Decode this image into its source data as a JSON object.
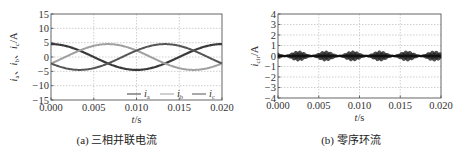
{
  "chart_data": [
    {
      "type": "line",
      "caption": "(a) 三相并联电流",
      "xlabel": "t/s",
      "ylabel": "ia、ib、ic/A",
      "xlim": [
        0.0,
        0.02
      ],
      "ylim": [
        -15,
        15
      ],
      "xticks": [
        "0.000",
        "0.005",
        "0.010",
        "0.015",
        "0.020"
      ],
      "yticks": [
        "15",
        "10",
        "5",
        "0",
        "-5",
        "-10",
        "-15"
      ],
      "grid": true,
      "legend_position": "lower right",
      "series": [
        {
          "name": "ia",
          "color": "#3a3a3a",
          "amplitude": 4.5,
          "frequency_hz": 50,
          "phase_deg": 0,
          "x": [
            0.0,
            0.0025,
            0.005,
            0.0075,
            0.01,
            0.0125,
            0.015,
            0.0175,
            0.02
          ],
          "values": [
            4.5,
            3.2,
            0.0,
            -3.2,
            -4.5,
            -3.2,
            0.0,
            3.2,
            4.5
          ]
        },
        {
          "name": "ib",
          "color": "#a0a0a0",
          "amplitude": 4.5,
          "frequency_hz": 50,
          "phase_deg": -120,
          "x": [
            0.0,
            0.0025,
            0.005,
            0.0075,
            0.01,
            0.0125,
            0.015,
            0.0175,
            0.02
          ],
          "values": [
            -2.25,
            -4.35,
            -3.9,
            -1.16,
            2.25,
            4.35,
            3.9,
            1.16,
            -2.25
          ]
        },
        {
          "name": "ic",
          "color": "#555555",
          "amplitude": 4.5,
          "frequency_hz": 50,
          "phase_deg": 120,
          "x": [
            0.0,
            0.0025,
            0.005,
            0.0075,
            0.01,
            0.0125,
            0.015,
            0.0175,
            0.02
          ],
          "values": [
            -2.25,
            1.16,
            3.9,
            4.35,
            2.25,
            -1.16,
            -3.9,
            -4.35,
            -2.25
          ]
        }
      ],
      "legend": [
        "ia",
        "ib",
        "ic"
      ]
    },
    {
      "type": "line",
      "caption": "(b) 零序环流",
      "xlabel": "t/s",
      "ylabel": "icir/A",
      "xlim": [
        0.0,
        0.02
      ],
      "ylim": [
        -4,
        4
      ],
      "xticks": [
        "0.000",
        "0.005",
        "0.010",
        "0.015",
        "0.020"
      ],
      "yticks": [
        "4",
        "3",
        "2",
        "1",
        "0",
        "-1",
        "-2",
        "-3",
        "-4"
      ],
      "grid": true,
      "series": [
        {
          "name": "icir",
          "color": "#222222",
          "description": "high-frequency ripple centred at 0 with envelope amplitude ~0.1–0.5 A, envelope peaks near 0.0025, 0.0055, 0.009, 0.012, 0.0155, 0.019 s",
          "x": [
            0.0,
            0.0025,
            0.004,
            0.0055,
            0.007,
            0.009,
            0.0105,
            0.012,
            0.0135,
            0.0155,
            0.017,
            0.019,
            0.02
          ],
          "envelope": [
            0.15,
            0.5,
            0.15,
            0.5,
            0.15,
            0.5,
            0.15,
            0.5,
            0.15,
            0.5,
            0.15,
            0.5,
            0.15
          ]
        }
      ]
    }
  ],
  "panels": {
    "a": {
      "caption": "(a) 三相并联电流",
      "xlabel": "t/s",
      "ylabel": "i",
      "legend": [
        {
          "label": "i",
          "sub": "a"
        },
        {
          "label": "i",
          "sub": "b"
        },
        {
          "label": "i",
          "sub": "c"
        }
      ]
    },
    "b": {
      "caption": "(b) 零序环流",
      "xlabel": "t/s"
    }
  }
}
